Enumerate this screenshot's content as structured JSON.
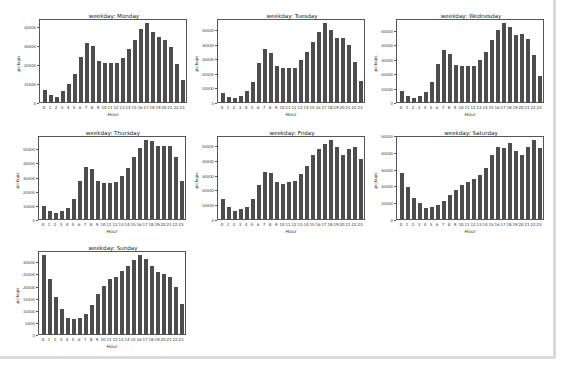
{
  "chart_data": [
    {
      "type": "bar",
      "title": "weekday: Monday",
      "xlabel": "Hour",
      "ylabel": "pickups",
      "categories": [
        "0",
        "1",
        "2",
        "3",
        "4",
        "5",
        "6",
        "7",
        "8",
        "9",
        "10",
        "11",
        "12",
        "13",
        "14",
        "15",
        "16",
        "17",
        "18",
        "19",
        "20",
        "21",
        "22",
        "23"
      ],
      "values": [
        6500,
        3800,
        2800,
        6000,
        9500,
        15000,
        24000,
        31500,
        29500,
        22000,
        20500,
        20500,
        20500,
        23500,
        28000,
        33000,
        39000,
        42000,
        37000,
        34500,
        33000,
        29000,
        20000,
        11500
      ],
      "yticks": [
        0,
        10000,
        20000,
        30000,
        40000
      ],
      "ylim": [
        0,
        44100
      ],
      "grid": false
    },
    {
      "type": "bar",
      "title": "weekday: Tuesday",
      "xlabel": "Hour",
      "ylabel": "pickups",
      "categories": [
        "0",
        "1",
        "2",
        "3",
        "4",
        "5",
        "6",
        "7",
        "8",
        "9",
        "10",
        "11",
        "12",
        "13",
        "14",
        "15",
        "16",
        "17",
        "18",
        "19",
        "20",
        "21",
        "22",
        "23"
      ],
      "values": [
        6000,
        3500,
        2500,
        4500,
        7500,
        14000,
        27000,
        37000,
        34000,
        25000,
        24000,
        24000,
        24000,
        29000,
        35000,
        41500,
        48500,
        55000,
        50000,
        44500,
        44500,
        40000,
        28000,
        14500
      ],
      "yticks": [
        0,
        10000,
        20000,
        30000,
        40000,
        50000
      ],
      "ylim": [
        0,
        57750
      ],
      "grid": false
    },
    {
      "type": "bar",
      "title": "weekday: Wednesday",
      "xlabel": "Hour",
      "ylabel": "pickups",
      "categories": [
        "0",
        "1",
        "2",
        "3",
        "4",
        "5",
        "6",
        "7",
        "8",
        "9",
        "10",
        "11",
        "12",
        "13",
        "14",
        "15",
        "16",
        "17",
        "18",
        "19",
        "20",
        "21",
        "22",
        "23"
      ],
      "values": [
        7500,
        4500,
        3000,
        4500,
        7000,
        14000,
        27000,
        36500,
        34000,
        26000,
        25000,
        25000,
        25500,
        29500,
        35000,
        43500,
        50500,
        55500,
        53000,
        47000,
        47500,
        44500,
        33000,
        18000
      ],
      "yticks": [
        0,
        10000,
        20000,
        30000,
        40000,
        50000
      ],
      "ylim": [
        0,
        58300
      ],
      "grid": false
    },
    {
      "type": "bar",
      "title": "weekday: Thursday",
      "xlabel": "Hour",
      "ylabel": "pickups",
      "categories": [
        "0",
        "1",
        "2",
        "3",
        "4",
        "5",
        "6",
        "7",
        "8",
        "9",
        "10",
        "11",
        "12",
        "13",
        "14",
        "15",
        "16",
        "17",
        "18",
        "19",
        "20",
        "21",
        "22",
        "23"
      ],
      "values": [
        9500,
        5500,
        4000,
        5500,
        8000,
        14000,
        27000,
        37000,
        35500,
        27500,
        25500,
        26000,
        26500,
        31000,
        36500,
        44500,
        50500,
        56500,
        56000,
        52000,
        52000,
        52000,
        44000,
        27500
      ],
      "yticks": [
        0,
        10000,
        20000,
        30000,
        40000,
        50000
      ],
      "ylim": [
        0,
        59300
      ],
      "grid": false
    },
    {
      "type": "bar",
      "title": "weekday: Friday",
      "xlabel": "Hour",
      "ylabel": "pickups",
      "categories": [
        "0",
        "1",
        "2",
        "3",
        "4",
        "5",
        "6",
        "7",
        "8",
        "9",
        "10",
        "11",
        "12",
        "13",
        "14",
        "15",
        "16",
        "17",
        "18",
        "19",
        "20",
        "21",
        "22",
        "23"
      ],
      "values": [
        13500,
        8000,
        5500,
        7000,
        8500,
        13500,
        23500,
        32000,
        31500,
        25000,
        24000,
        25000,
        26000,
        30500,
        36500,
        43500,
        48000,
        51500,
        54000,
        49000,
        43500,
        48000,
        49000,
        41000
      ],
      "yticks": [
        0,
        10000,
        20000,
        30000,
        40000,
        50000
      ],
      "ylim": [
        0,
        56700
      ],
      "grid": false
    },
    {
      "type": "bar",
      "title": "weekday: Saturday",
      "xlabel": "Hour",
      "ylabel": "pickups",
      "categories": [
        "0",
        "1",
        "2",
        "3",
        "4",
        "5",
        "6",
        "7",
        "8",
        "9",
        "10",
        "11",
        "12",
        "13",
        "14",
        "15",
        "16",
        "17",
        "18",
        "19",
        "20",
        "21",
        "22",
        "23"
      ],
      "values": [
        27500,
        19000,
        12500,
        9500,
        6500,
        7000,
        8500,
        11000,
        14500,
        17500,
        20500,
        22500,
        24000,
        26500,
        31000,
        38500,
        43500,
        43000,
        45500,
        41000,
        38500,
        43500,
        47500,
        43000
      ],
      "yticks": [
        0,
        10000,
        20000,
        30000,
        40000,
        50000
      ],
      "ylim": [
        0,
        50000
      ],
      "grid": false
    },
    {
      "type": "bar",
      "title": "weekday: Sunday",
      "xlabel": "Hour",
      "ylabel": "pickups",
      "categories": [
        "0",
        "1",
        "2",
        "3",
        "4",
        "5",
        "6",
        "7",
        "8",
        "9",
        "10",
        "11",
        "12",
        "13",
        "14",
        "15",
        "16",
        "17",
        "18",
        "19",
        "20",
        "21",
        "22",
        "23"
      ],
      "values": [
        33000,
        23000,
        15500,
        10500,
        6500,
        6300,
        6700,
        8500,
        12000,
        16500,
        20000,
        23000,
        24000,
        26500,
        28500,
        31000,
        33000,
        31500,
        28500,
        26000,
        25000,
        24000,
        19500,
        12500
      ],
      "yticks": [
        0,
        5000,
        10000,
        15000,
        20000,
        25000,
        30000
      ],
      "ylim": [
        0,
        34650
      ],
      "grid": false
    }
  ],
  "layout": {
    "positions": [
      {
        "left": 13,
        "top": 13
      },
      {
        "left": 191,
        "top": 13
      },
      {
        "left": 370,
        "top": 13
      },
      {
        "left": 12,
        "top": 130
      },
      {
        "left": 191,
        "top": 130
      },
      {
        "left": 370,
        "top": 130
      },
      {
        "left": 12,
        "top": 245
      }
    ],
    "bar_color": "#4d4d4d",
    "border_color": "#d9d9d9"
  }
}
